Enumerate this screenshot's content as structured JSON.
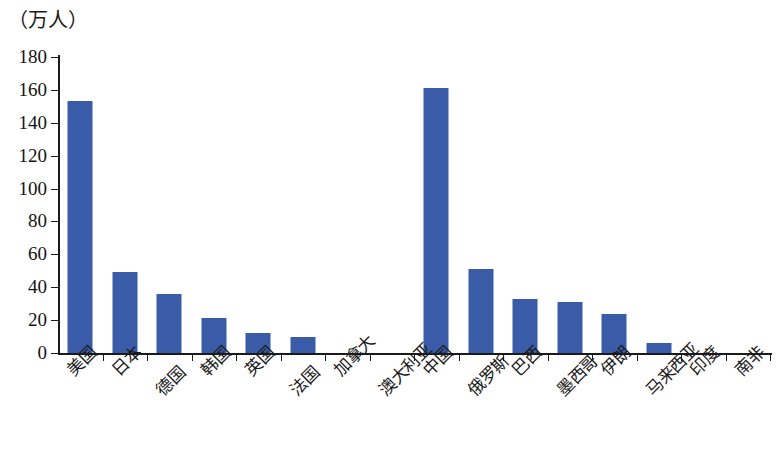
{
  "chart_data": {
    "type": "bar",
    "title": "",
    "subtitle": "",
    "unit_caption": "（万人）",
    "xlabel": "",
    "ylabel": "",
    "ylim": [
      0,
      180
    ],
    "ytick_step": 20,
    "yticks": [
      180,
      160,
      140,
      120,
      100,
      80,
      60,
      40,
      20,
      0
    ],
    "grid": false,
    "legend": null,
    "bar_color": "#3A5CA8",
    "axis_color": "#1a1a1a",
    "categories": [
      "美国",
      "日本",
      "德国",
      "韩国",
      "英国",
      "法国",
      "加拿大",
      "澳大利亚",
      "中国",
      "俄罗斯",
      "巴西",
      "墨西哥",
      "伊朗",
      "马来西亚",
      "印度",
      "南非"
    ],
    "values": [
      153,
      49,
      36,
      21,
      12,
      10,
      0,
      0,
      161,
      51,
      33,
      31,
      24,
      6,
      0,
      0
    ],
    "label_stagger": [
      0,
      0,
      1,
      0,
      0,
      1,
      0,
      1,
      0,
      1,
      0,
      1,
      0,
      1,
      0,
      0
    ]
  }
}
